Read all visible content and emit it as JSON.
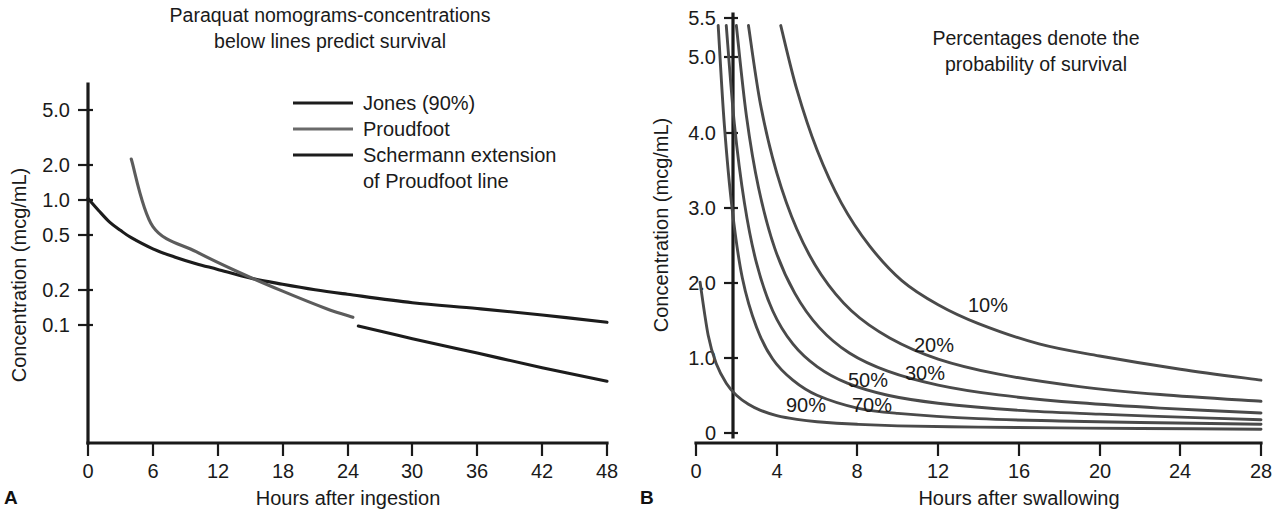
{
  "figure": {
    "panel_a_letter": "A",
    "panel_b_letter": "B"
  },
  "panel_a": {
    "title_line1": "Paraquat nomograms-concentrations",
    "title_line2": "below lines predict survival",
    "y_axis_label": "Concentration (mcg/mL)",
    "x_axis_label": "Hours after ingestion",
    "y_ticks": [
      "5.0",
      "2.0",
      "1.0",
      "0.5",
      "0.2",
      "0.1"
    ],
    "x_ticks": [
      "0",
      "6",
      "12",
      "18",
      "24",
      "30",
      "36",
      "42",
      "48"
    ],
    "legend": [
      {
        "label": "Jones (90%)",
        "color": "#1c1c1c"
      },
      {
        "label": "Proudfoot",
        "color": "#6a6a6a"
      },
      {
        "label": "Schermann extension",
        "label2": "of Proudfoot line",
        "color": "#1c1c1c"
      }
    ]
  },
  "panel_b": {
    "title_line1": "Percentages denote the",
    "title_line2": "probability of survival",
    "y_axis_label": "Concentration (mcg/mL)",
    "x_axis_label": "Hours after swallowing",
    "y_ticks": [
      "5.5",
      "5.0",
      "4.0",
      "3.0",
      "2.0",
      "1.0",
      "0"
    ],
    "x_ticks": [
      "0",
      "4",
      "8",
      "12",
      "16",
      "20",
      "24",
      "28"
    ],
    "curve_labels": [
      "90%",
      "70%",
      "50%",
      "30%",
      "20%",
      "10%"
    ]
  },
  "chart_data": [
    {
      "type": "line",
      "panel": "A",
      "title": "Paraquat nomograms-concentrations below lines predict survival",
      "xlabel": "Hours after ingestion",
      "ylabel": "Concentration (mcg/mL)",
      "xlim": [
        0,
        48
      ],
      "ylim": [
        0.03,
        7.0
      ],
      "yscale": "log",
      "xscale": "linear",
      "xticks": [
        0,
        6,
        12,
        18,
        24,
        30,
        36,
        42,
        48
      ],
      "yticks": [
        5.0,
        2.0,
        1.0,
        0.5,
        0.2,
        0.1
      ],
      "grid": false,
      "legend_position": "upper-right-inside",
      "series": [
        {
          "name": "Jones (90%)",
          "color": "#1c1c1c",
          "x": [
            0,
            1,
            2,
            3,
            4,
            6,
            8,
            10,
            12,
            15,
            18,
            21,
            24,
            30,
            36,
            42,
            48
          ],
          "y": [
            1.0,
            0.8,
            0.65,
            0.56,
            0.49,
            0.4,
            0.345,
            0.305,
            0.275,
            0.235,
            0.21,
            0.19,
            0.175,
            0.15,
            0.135,
            0.12,
            0.105
          ]
        },
        {
          "name": "Proudfoot",
          "color": "#6a6a6a",
          "x": [
            4,
            6,
            10,
            14,
            18,
            22,
            24.5
          ],
          "y": [
            2.05,
            0.6,
            0.38,
            0.26,
            0.185,
            0.135,
            0.115
          ]
        },
        {
          "name": "Schermann extension of Proudfoot line",
          "color": "#1c1c1c",
          "x": [
            25,
            30,
            36,
            42,
            48
          ],
          "y": [
            0.098,
            0.078,
            0.06,
            0.046,
            0.036
          ]
        }
      ]
    },
    {
      "type": "line",
      "panel": "B",
      "title": "Percentages denote the probability of survival",
      "xlabel": "Hours after swallowing",
      "ylabel": "Concentration (mcg/mL)",
      "xlim": [
        0,
        28
      ],
      "ylim": [
        0,
        5.5
      ],
      "yscale": "linear",
      "xscale": "linear",
      "xticks": [
        0,
        4,
        8,
        12,
        16,
        20,
        24,
        28
      ],
      "yticks": [
        0,
        1.0,
        2.0,
        3.0,
        4.0,
        5.0,
        5.5
      ],
      "grid": false,
      "legend_position": "inline-labels",
      "series": [
        {
          "name": "90%",
          "color": "#4a4a4a",
          "x": [
            0.2,
            0.6,
            1.0,
            1.5,
            2.0,
            2.6,
            3.2,
            4.0,
            5.0,
            6.0,
            8.0,
            10.0,
            14.0,
            18.0,
            22.0,
            28.0
          ],
          "y": [
            2.0,
            1.3,
            0.92,
            0.66,
            0.5,
            0.38,
            0.3,
            0.23,
            0.18,
            0.15,
            0.115,
            0.095,
            0.078,
            0.068,
            0.06,
            0.05
          ]
        },
        {
          "name": "70%",
          "color": "#4a4a4a",
          "x": [
            1.1,
            1.4,
            1.8,
            2.3,
            3.0,
            3.8,
            4.8,
            6.0,
            8.0,
            10.0,
            14.0,
            18.0,
            22.0,
            28.0
          ],
          "y": [
            5.4,
            4.1,
            2.95,
            2.05,
            1.4,
            0.98,
            0.7,
            0.5,
            0.33,
            0.26,
            0.19,
            0.16,
            0.14,
            0.115
          ]
        },
        {
          "name": "50%",
          "color": "#4a4a4a",
          "x": [
            1.5,
            1.9,
            2.4,
            3.0,
            3.8,
            4.8,
            6.0,
            7.5,
            9.5,
            12.0,
            16.0,
            20.0,
            24.0,
            28.0
          ],
          "y": [
            5.4,
            4.1,
            3.05,
            2.25,
            1.62,
            1.18,
            0.88,
            0.66,
            0.5,
            0.395,
            0.3,
            0.25,
            0.21,
            0.175
          ]
        },
        {
          "name": "30%",
          "color": "#4a4a4a",
          "x": [
            2.0,
            2.5,
            3.1,
            3.9,
            4.9,
            6.1,
            7.6,
            9.5,
            12.0,
            15.0,
            19.0,
            23.0,
            28.0
          ],
          "y": [
            5.4,
            4.2,
            3.25,
            2.45,
            1.85,
            1.4,
            1.06,
            0.82,
            0.635,
            0.505,
            0.4,
            0.33,
            0.265
          ]
        },
        {
          "name": "20%",
          "color": "#4a4a4a",
          "x": [
            2.6,
            3.2,
            4.0,
            5.0,
            6.2,
            7.7,
            9.6,
            12.0,
            15.0,
            19.0,
            23.0,
            28.0
          ],
          "y": [
            5.4,
            4.35,
            3.45,
            2.7,
            2.1,
            1.62,
            1.26,
            0.98,
            0.78,
            0.615,
            0.51,
            0.42
          ]
        },
        {
          "name": "10%",
          "color": "#4a4a4a",
          "x": [
            4.2,
            5.0,
            6.0,
            7.2,
            8.6,
            10.2,
            12.0,
            14.0,
            17.0,
            20.0,
            24.0,
            28.0
          ],
          "y": [
            5.4,
            4.55,
            3.75,
            3.05,
            2.48,
            2.02,
            1.7,
            1.45,
            1.18,
            1.02,
            0.845,
            0.7
          ]
        }
      ]
    }
  ]
}
